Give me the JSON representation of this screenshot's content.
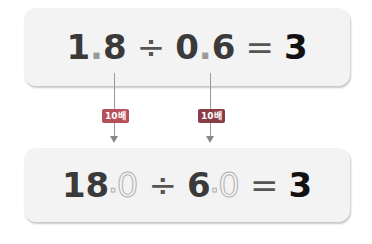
{
  "top_equation": {
    "whole1": "1",
    "dot1": ".",
    "frac1": "8",
    "op": "÷",
    "whole2": "0",
    "dot2": ".",
    "frac2": "6",
    "eq": "=",
    "answer": "3"
  },
  "bottom_equation": {
    "num1": "18",
    "dot1": ".",
    "ghost1": "0",
    "op": "÷",
    "num2": "6",
    "dot2": ".",
    "ghost2": "0",
    "eq": "=",
    "answer": "3"
  },
  "badges": [
    {
      "label": "10배",
      "color": "#b5505a"
    },
    {
      "label": "10배",
      "color": "#8a3d47"
    }
  ]
}
